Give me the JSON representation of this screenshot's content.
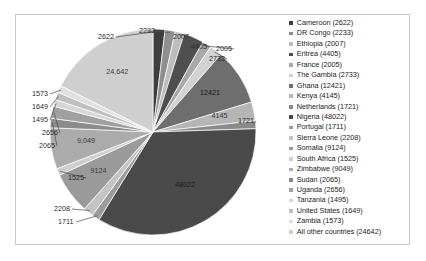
{
  "chart_data": {
    "type": "pie",
    "title": "",
    "legend_position": "right",
    "value_label_format": "plain-with-some-comma-grouping",
    "total": 139591,
    "categories": [
      "Cameroon",
      "DR Congo",
      "Ethiopia",
      "Eritrea",
      "France",
      "The Gambia",
      "Ghana",
      "Kenya",
      "Netherlands",
      "Nigeria",
      "Portugal",
      "Sierra Leone",
      "Somalia",
      "South Africa",
      "Zimbabwe",
      "Sudan",
      "Uganda",
      "Tanzania",
      "United States",
      "Zambia",
      "All other countries"
    ],
    "values": [
      2622,
      2233,
      2007,
      4405,
      2005,
      2733,
      12421,
      4145,
      1721,
      48022,
      1711,
      2208,
      9124,
      1525,
      9049,
      2065,
      2656,
      1495,
      1649,
      1573,
      24642
    ],
    "slice_labels": [
      "2622",
      "2233",
      "2007",
      "4405",
      "2005",
      "2733",
      "12421",
      "4145",
      "1721",
      "48022",
      "1711",
      "2208",
      "9124",
      "1525",
      "9,049",
      "2065",
      "2656",
      "1495",
      "1649",
      "1573",
      "24,642"
    ],
    "colors": [
      "#3d3d3d",
      "#8f8f8f",
      "#bdbdbd",
      "#4f4f4f",
      "#a8a8a8",
      "#d2d2d2",
      "#6e6e6e",
      "#b5b5b5",
      "#8a8a8a",
      "#4a4a4a",
      "#9c9c9c",
      "#c4c4c4",
      "#9a9a9a",
      "#cfcfcf",
      "#ababab",
      "#8b8b8b",
      "#a0a0a0",
      "#d6d6d6",
      "#bfbfbf",
      "#e0e0e0",
      "#cfcfcf"
    ]
  },
  "legend": {
    "items": [
      {
        "label": "Cameroon (2622)",
        "color": "#3d3d3d"
      },
      {
        "label": "DR Congo (2233)",
        "color": "#8f8f8f"
      },
      {
        "label": "Ethiopia (2007)",
        "color": "#bdbdbd"
      },
      {
        "label": "Eritrea (4405)",
        "color": "#4f4f4f"
      },
      {
        "label": "France (2005)",
        "color": "#a8a8a8"
      },
      {
        "label": "The Gambia (2733)",
        "color": "#d2d2d2"
      },
      {
        "label": "Ghana (12421)",
        "color": "#6e6e6e"
      },
      {
        "label": "Kenya (4145)",
        "color": "#b5b5b5"
      },
      {
        "label": "Netherlands (1721)",
        "color": "#8a8a8a"
      },
      {
        "label": "Nigeria (48022)",
        "color": "#4a4a4a"
      },
      {
        "label": "Portugal (1711)",
        "color": "#9c9c9c"
      },
      {
        "label": "Sierra Leone (2208)",
        "color": "#c4c4c4"
      },
      {
        "label": "Somalia (9124)",
        "color": "#9a9a9a"
      },
      {
        "label": "South Africa (1525)",
        "color": "#cfcfcf"
      },
      {
        "label": "Zimbabwe (9049)",
        "color": "#ababab"
      },
      {
        "label": "Sudan (2065)",
        "color": "#8b8b8b"
      },
      {
        "label": "Uganda (2656)",
        "color": "#a0a0a0"
      },
      {
        "label": "Tanzania (1495)",
        "color": "#d6d6d6"
      },
      {
        "label": "United States (1649)",
        "color": "#bfbfbf"
      },
      {
        "label": "Zambia (1573)",
        "color": "#e0e0e0"
      },
      {
        "label": "All other countries (24642)",
        "color": "#cfcfcf"
      }
    ]
  }
}
